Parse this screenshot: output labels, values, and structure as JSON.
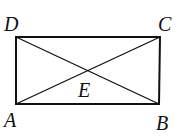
{
  "figure": {
    "type": "rectangle-with-diagonals",
    "stroke_color": "#111111",
    "background": "#ffffff",
    "points": {
      "A": {
        "label": "A",
        "x": 16,
        "y": 104
      },
      "B": {
        "label": "B",
        "x": 158,
        "y": 104
      },
      "C": {
        "label": "C",
        "x": 160,
        "y": 37
      },
      "D": {
        "label": "D",
        "x": 16,
        "y": 37
      },
      "E": {
        "label": "E",
        "x": 88,
        "y": 71
      }
    },
    "segments": [
      "AB",
      "BC",
      "CD",
      "DA",
      "AC",
      "BD"
    ],
    "labels": {
      "A": "A",
      "B": "B",
      "C": "C",
      "D": "D",
      "E": "E"
    }
  }
}
